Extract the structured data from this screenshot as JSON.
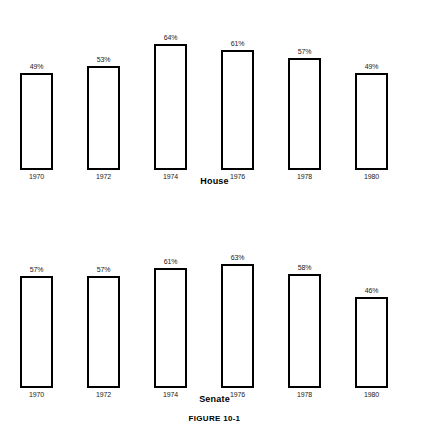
{
  "figure": {
    "caption": "FIGURE 10-1"
  },
  "chart_data": [
    {
      "type": "bar",
      "title": "House",
      "xlabel": "",
      "ylabel": "",
      "ylim": [
        0,
        70
      ],
      "grid": false,
      "legend": "none",
      "categories": [
        "1970",
        "1972",
        "1974",
        "1976",
        "1978",
        "1980"
      ],
      "values": [
        49,
        53,
        64,
        61,
        57,
        49
      ],
      "value_labels": [
        "49%",
        "53%",
        "64%",
        "61%",
        "57%",
        "49%"
      ]
    },
    {
      "type": "bar",
      "title": "Senate",
      "xlabel": "",
      "ylabel": "",
      "ylim": [
        0,
        70
      ],
      "grid": false,
      "legend": "none",
      "categories": [
        "1970",
        "1972",
        "1974",
        "1976",
        "1978",
        "1980"
      ],
      "values": [
        57,
        57,
        61,
        63,
        58,
        46
      ],
      "value_labels": [
        "57%",
        "57%",
        "61%",
        "63%",
        "58%",
        "46%"
      ]
    }
  ]
}
